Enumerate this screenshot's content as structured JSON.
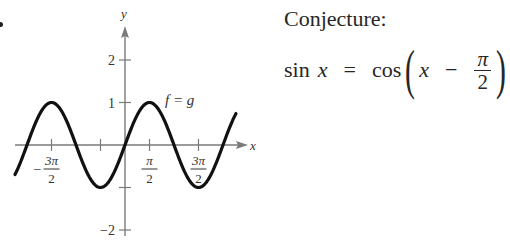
{
  "figure": {
    "conjecture_label": "Conjecture:",
    "equation": {
      "lhs_func": "sin",
      "lhs_var": "x",
      "equals": "=",
      "rhs_func": "cos",
      "open_paren": "(",
      "rhs_var": "x",
      "minus": "−",
      "frac_num": "π",
      "frac_den": "2",
      "close_paren": ")"
    }
  },
  "chart_data": {
    "type": "line",
    "title": "",
    "xlabel": "x",
    "ylabel": "y",
    "curve_label": "f = g",
    "function": "sin(x)",
    "series": [
      {
        "name": "f = g",
        "x": [
          -4.91,
          -4.71,
          -3.93,
          -3.14,
          -2.36,
          -1.57,
          -0.79,
          0,
          0.79,
          1.57,
          2.36,
          3.14,
          3.93,
          4.71,
          5.5,
          5.73
        ],
        "values": [
          0.98,
          1,
          0.71,
          0,
          -0.71,
          -1,
          -0.71,
          0,
          0.71,
          1,
          0.71,
          0,
          -0.71,
          -1,
          -0.71,
          -0.53
        ]
      }
    ],
    "x_ticks": [
      {
        "value": -4.712,
        "label_num": "3π",
        "label_den": "2",
        "sign": "−"
      },
      {
        "value": -1.571,
        "label_num": "",
        "label_den": "",
        "sign": ""
      },
      {
        "value": 1.571,
        "label_num": "π",
        "label_den": "2",
        "sign": ""
      },
      {
        "value": 4.712,
        "label_num": "3π",
        "label_den": "2",
        "sign": ""
      }
    ],
    "y_ticks": [
      {
        "value": 2,
        "label": "2"
      },
      {
        "value": 1,
        "label": "1"
      },
      {
        "value": -1,
        "label": ""
      },
      {
        "value": -2,
        "label": "−2"
      }
    ],
    "xlim": [
      -7.2,
      7.9
    ],
    "ylim": [
      -2.2,
      2.8
    ],
    "grid": false,
    "legend": "none",
    "colors": {
      "curve": "#111111",
      "axis": "#7a7a7a"
    }
  }
}
